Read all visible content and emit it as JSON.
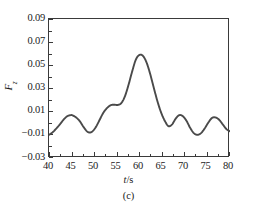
{
  "figure": {
    "panel_caption": "(c)",
    "x_axis_title_prefix": "t",
    "x_axis_title_suffix": "/s",
    "y_axis_title_symbol": "F",
    "y_axis_title_subscript": "z"
  },
  "axes": {
    "y_tick_labels": [
      "0.09",
      "0.07",
      "0.05",
      "0.03",
      "0.01",
      "−0.01",
      "−0.03"
    ],
    "x_tick_labels": [
      "40",
      "45",
      "50",
      "55",
      "60",
      "65",
      "70",
      "75",
      "80"
    ]
  },
  "style": {
    "curve_color": "#4a4a4a",
    "frame_color": "#3a3a3a",
    "background": "#ffffff"
  },
  "chart_data": {
    "type": "line",
    "title": "",
    "subtitle": "",
    "xlabel": "t/s",
    "ylabel": "F_z",
    "annotations": [
      "(c)"
    ],
    "legend": [],
    "legend_position": "none",
    "grid": false,
    "xlim": [
      40,
      80
    ],
    "ylim": [
      -0.03,
      0.09
    ],
    "xticks": [
      40,
      45,
      50,
      55,
      60,
      65,
      70,
      75,
      80
    ],
    "yticks": [
      -0.03,
      -0.01,
      0.01,
      0.03,
      0.05,
      0.07,
      0.09
    ],
    "series": [
      {
        "name": "F_z",
        "color": "#4a4a4a",
        "x": [
          40.0,
          40.8,
          41.6,
          42.4,
          43.2,
          44.0,
          44.8,
          45.2,
          46.0,
          46.8,
          47.6,
          48.4,
          49.0,
          49.6,
          50.4,
          51.2,
          52.0,
          52.8,
          53.6,
          54.4,
          55.2,
          56.0,
          56.8,
          57.6,
          58.4,
          59.2,
          60.0,
          60.8,
          61.6,
          62.4,
          63.2,
          64.0,
          64.8,
          65.6,
          66.4,
          67.2,
          68.0,
          68.8,
          69.6,
          70.4,
          71.2,
          72.0,
          72.8,
          73.6,
          74.4,
          75.2,
          76.0,
          76.8,
          77.6,
          78.4,
          79.2,
          80.0
        ],
        "y": [
          -0.01,
          -0.0078,
          -0.0046,
          -0.001,
          0.003,
          0.006,
          0.007,
          0.0068,
          0.005,
          0.0018,
          -0.003,
          -0.007,
          -0.008,
          -0.007,
          -0.003,
          0.003,
          0.009,
          0.013,
          0.0155,
          0.016,
          0.0158,
          0.0175,
          0.0235,
          0.0335,
          0.045,
          0.055,
          0.059,
          0.058,
          0.052,
          0.042,
          0.03,
          0.0185,
          0.009,
          0.002,
          -0.0025,
          -0.001,
          0.004,
          0.007,
          0.006,
          0.002,
          -0.004,
          -0.0085,
          -0.01,
          -0.0085,
          -0.0045,
          0.0005,
          0.0045,
          0.005,
          0.003,
          -0.001,
          -0.005,
          -0.007
        ]
      }
    ],
    "key_points": [
      {
        "label": "start",
        "x": 40.0,
        "y": -0.01
      },
      {
        "label": "local-max-1",
        "x": 45.0,
        "y": 0.007
      },
      {
        "label": "local-min-1",
        "x": 48.8,
        "y": -0.008
      },
      {
        "label": "shoulder",
        "x": 54.6,
        "y": 0.016
      },
      {
        "label": "global-max",
        "x": 60.0,
        "y": 0.059
      },
      {
        "label": "local-min-2",
        "x": 66.4,
        "y": -0.003
      },
      {
        "label": "local-max-2",
        "x": 68.8,
        "y": 0.007
      },
      {
        "label": "local-min-3",
        "x": 72.8,
        "y": -0.01
      },
      {
        "label": "local-max-3",
        "x": 76.6,
        "y": 0.005
      },
      {
        "label": "end",
        "x": 80.0,
        "y": -0.007
      }
    ]
  }
}
